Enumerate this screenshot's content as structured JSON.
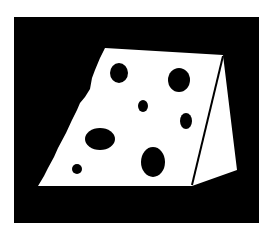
{
  "image": {
    "subject": "cheese-wedge",
    "colors": {
      "background": "#ffffff",
      "frame": "#000000",
      "cheese": "#ffffff",
      "holes": "#000000",
      "edge_line": "#000000"
    }
  }
}
